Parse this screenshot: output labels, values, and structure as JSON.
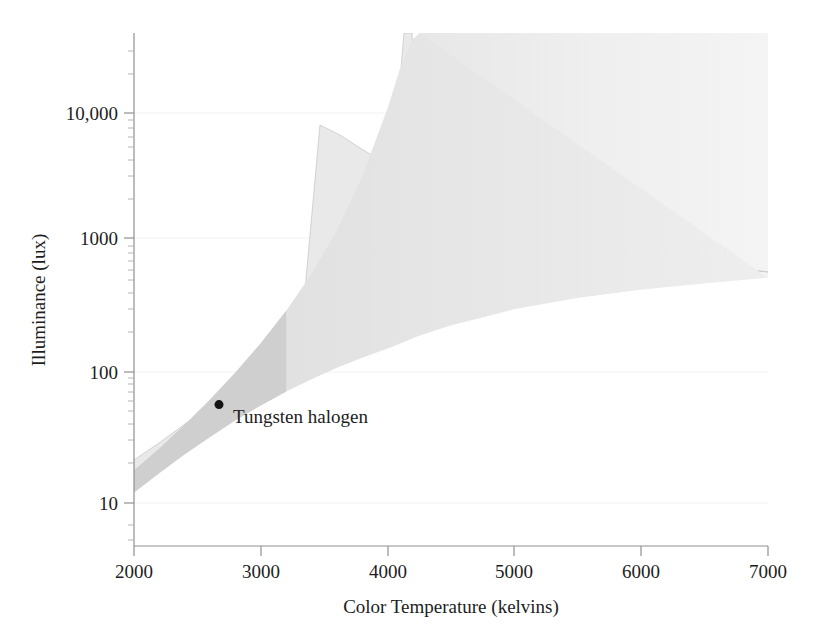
{
  "figure": {
    "background_color": "#ffffff",
    "plot_area": {
      "left": 134,
      "top": 33,
      "right": 768,
      "bottom": 546
    }
  },
  "chart_data": {
    "type": "area",
    "title": "",
    "subtitle": "",
    "xlabel": "Color Temperature (kelvins)",
    "ylabel": "Illuminance (lux)",
    "xlim": [
      2000,
      7000
    ],
    "ylim": [
      6,
      40000
    ],
    "yscale": "log",
    "xscale": "linear",
    "grid": false,
    "legend": null,
    "xticks": [
      2000,
      3000,
      4000,
      5000,
      6000,
      7000
    ],
    "xtick_labels": [
      "2000",
      "3000",
      "4000",
      "5000",
      "6000",
      "7000"
    ],
    "yticks": [
      10,
      100,
      1000,
      10000
    ],
    "ytick_labels": [
      "10",
      "100",
      "1000",
      "10,000"
    ],
    "yminor_ticks": [
      20,
      30,
      40,
      50,
      60,
      70,
      80,
      90,
      200,
      300,
      400,
      500,
      600,
      700,
      800,
      900,
      2000,
      3000,
      4000,
      5000,
      6000,
      7000,
      8000,
      9000,
      20000,
      30000
    ],
    "series": [
      {
        "name": "Pleasing region (upper bound)",
        "role": "upper-boundary",
        "color": "#c9c9c9",
        "x": [
          2000,
          2200,
          2400,
          2600,
          2800,
          3000,
          3200,
          3400,
          3600,
          3800,
          4000,
          4100,
          4200,
          4250
        ],
        "y": [
          22,
          32,
          48,
          74,
          118,
          195,
          340,
          640,
          1350,
          3400,
          11000,
          22000,
          36000,
          42000
        ]
      },
      {
        "name": "Pleasing region (lower bound)",
        "role": "lower-boundary",
        "color": "#c9c9c9",
        "x": [
          2000,
          2200,
          2400,
          2600,
          2800,
          3000,
          3200,
          3400,
          3600,
          3800,
          4000,
          4250,
          4500,
          5000,
          5500,
          6000,
          6500,
          7000
        ],
        "y": [
          15,
          21,
          29,
          39,
          52,
          67,
          85,
          105,
          128,
          152,
          178,
          222,
          265,
          350,
          425,
          490,
          545,
          600
        ]
      },
      {
        "name": "Saturated top region",
        "role": "upper-fill-to-top",
        "color": "#ededed",
        "x": [
          4250,
          7000
        ],
        "y": [
          42000,
          42000
        ]
      }
    ],
    "annotations": [
      {
        "name": "Tungsten halogen",
        "text": "Tungsten halogen",
        "x": 2670,
        "y": 68,
        "marker": "dot",
        "marker_color": "#141414",
        "label_offset_px": {
          "x": 14,
          "y": 18
        }
      }
    ],
    "band_colors": {
      "outer_band": "#e9e9e9",
      "inner_band": "#cfcfcf",
      "top_region": "#ededed",
      "boundary_stroke": "#c9c9c9"
    }
  },
  "axes": {
    "x_axis_title": "Color Temperature (kelvins)",
    "y_axis_title": "Illuminance (lux)"
  }
}
